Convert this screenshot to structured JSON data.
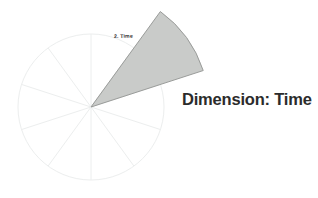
{
  "background_color": "#ffffff",
  "heading": {
    "text": "Dimension: Time",
    "color": "#2b2b2b"
  },
  "chart_data": {
    "type": "pie",
    "title": "Dimension: Time",
    "xlabel": "",
    "ylabel": "",
    "grid": false,
    "legend_position": "none",
    "center": {
      "x": 91,
      "y": 107
    },
    "radius": 73,
    "segment_count": 10,
    "segment_angle_degrees": 36,
    "categories": [
      "1",
      "2. Time",
      "3",
      "4",
      "5",
      "6",
      "7",
      "8",
      "9",
      "10"
    ],
    "values": [
      10,
      10,
      10,
      10,
      10,
      10,
      10,
      10,
      10,
      10
    ],
    "colors": {
      "outline": "#eceeee",
      "spoke": "#eceeee",
      "highlight_fill": "#c9cbc9",
      "highlight_stroke": "#9a9c9a"
    },
    "highlighted_index": 1,
    "highlighted_label": "2. Time",
    "highlight_exploded": true,
    "highlight_radius": 118,
    "annotations": [
      {
        "text": "2. Time",
        "target": "highlighted-slice"
      }
    ]
  },
  "slice_label": {
    "text": "2. Time"
  }
}
